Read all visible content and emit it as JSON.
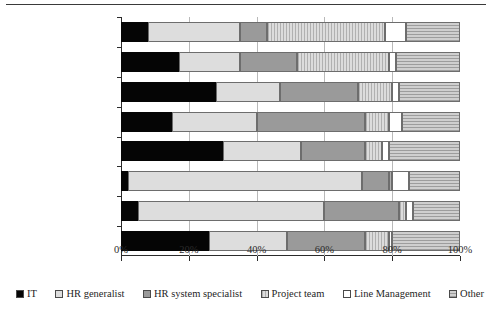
{
  "chart_data": {
    "type": "bar",
    "subtype": "horizontal-stacked-percent",
    "title": "",
    "xlabel": "",
    "ylabel": "",
    "xlim": [
      0,
      100
    ],
    "xticks": [
      0,
      20,
      40,
      60,
      80,
      100
    ],
    "xtick_labels": [
      "0%",
      "20%",
      "40%",
      "60%",
      "80%",
      "100%"
    ],
    "grid": true,
    "legend_position": "bottom",
    "categories": [
      "Decision to purchase",
      "Implementation",
      "Liaison with system\nsupplier",
      "Systems training",
      "Security procedures",
      "Updating records",
      "Queries & reports",
      "System enhancements"
    ],
    "series": [
      {
        "name": "IT",
        "swatch": "sw-it",
        "color": "#050505",
        "values": [
          8,
          17,
          28,
          15,
          30,
          2,
          5,
          26
        ]
      },
      {
        "name": "HR generalist",
        "swatch": "sw-hrgen",
        "color": "#dddddd",
        "values": [
          27,
          18,
          19,
          25,
          23,
          69,
          55,
          23
        ]
      },
      {
        "name": "HR system specialist",
        "swatch": "sw-hrspec",
        "color": "#9a9a9a",
        "values": [
          8,
          17,
          23,
          32,
          19,
          8,
          22,
          23
        ]
      },
      {
        "name": "Project team",
        "swatch": "sw-proj",
        "color": "#d2d2d2",
        "values": [
          35,
          27,
          10,
          7,
          5,
          1,
          2,
          7
        ]
      },
      {
        "name": "Line Management",
        "swatch": "sw-line",
        "color": "#ffffff",
        "values": [
          6,
          2,
          2,
          4,
          2,
          5,
          2,
          1
        ]
      },
      {
        "name": "Other",
        "swatch": "sw-other",
        "color": "#bdbdbd",
        "values": [
          16,
          19,
          18,
          17,
          21,
          15,
          14,
          20
        ]
      }
    ]
  }
}
